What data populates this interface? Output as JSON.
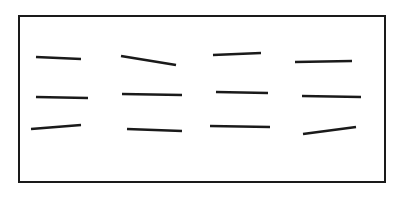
{
  "diagram": {
    "background": "#ffffff",
    "stroke_color": "#1a1a1a",
    "frame": {
      "x": 19,
      "y": 16,
      "width": 366,
      "height": 166,
      "stroke_width": 2
    },
    "segment_stroke_width": 2.6,
    "rows": [
      {
        "segments": [
          {
            "x1": 36,
            "y1": 57,
            "x2": 81,
            "y2": 59
          },
          {
            "x1": 121,
            "y1": 56,
            "x2": 176,
            "y2": 65
          },
          {
            "x1": 213,
            "y1": 55,
            "x2": 261,
            "y2": 53
          },
          {
            "x1": 295,
            "y1": 62,
            "x2": 352,
            "y2": 61
          }
        ]
      },
      {
        "segments": [
          {
            "x1": 36,
            "y1": 97,
            "x2": 88,
            "y2": 98
          },
          {
            "x1": 122,
            "y1": 94,
            "x2": 182,
            "y2": 95
          },
          {
            "x1": 216,
            "y1": 92,
            "x2": 268,
            "y2": 93
          },
          {
            "x1": 302,
            "y1": 96,
            "x2": 361,
            "y2": 97
          }
        ]
      },
      {
        "segments": [
          {
            "x1": 31,
            "y1": 129,
            "x2": 81,
            "y2": 125
          },
          {
            "x1": 127,
            "y1": 129,
            "x2": 182,
            "y2": 131
          },
          {
            "x1": 210,
            "y1": 126,
            "x2": 270,
            "y2": 127
          },
          {
            "x1": 303,
            "y1": 134,
            "x2": 356,
            "y2": 127
          }
        ]
      }
    ]
  }
}
